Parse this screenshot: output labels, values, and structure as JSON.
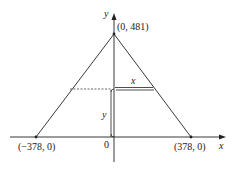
{
  "diagram": {
    "type": "triangle-inscribed-rectangle",
    "axes": {
      "x_label": "x",
      "y_label": "y",
      "origin_label": "0"
    },
    "points": {
      "apex": "(0, 481)",
      "left_base": "(−378, 0)",
      "right_base": "(378, 0)"
    },
    "rectangle": {
      "width_label": "x",
      "height_label": "y"
    },
    "colors": {
      "line": "#222222",
      "background": "#ffffff"
    }
  }
}
